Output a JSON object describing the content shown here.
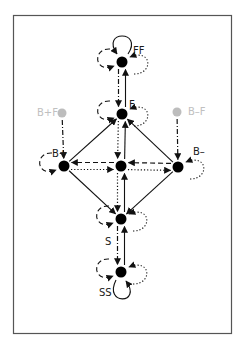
{
  "diagram": {
    "type": "state-transition",
    "colors": {
      "frame": "#555555",
      "node": "#000000",
      "ghost_node": "#bdbdbd",
      "edge": "#111111",
      "label": "#1a1a1a",
      "ghost_label": "#c0c0c0"
    },
    "nodes": [
      {
        "id": "FF",
        "label": "FF",
        "kind": "state"
      },
      {
        "id": "F",
        "label": "F",
        "kind": "state"
      },
      {
        "id": "BpF",
        "label": "B+F",
        "kind": "ghost"
      },
      {
        "id": "BmF",
        "label": "B–F",
        "kind": "ghost"
      },
      {
        "id": "Bp",
        "label": "B+",
        "kind": "state"
      },
      {
        "id": "C",
        "label": "",
        "kind": "state"
      },
      {
        "id": "Bm",
        "label": "B–",
        "kind": "state"
      },
      {
        "id": "S",
        "label": "S",
        "kind": "state"
      },
      {
        "id": "SS",
        "label": "SS",
        "kind": "state"
      }
    ],
    "edges": [
      {
        "from": "FF",
        "to": "F",
        "style": "dashdot"
      },
      {
        "from": "F",
        "to": "FF",
        "style": "solid"
      },
      {
        "from": "F",
        "to": "C",
        "style": "dotted"
      },
      {
        "from": "C",
        "to": "F",
        "style": "solid"
      },
      {
        "from": "C",
        "to": "S",
        "style": "dotted"
      },
      {
        "from": "S",
        "to": "C",
        "style": "solid"
      },
      {
        "from": "S",
        "to": "SS",
        "style": "dashdot"
      },
      {
        "from": "SS",
        "to": "S",
        "style": "solid"
      },
      {
        "from": "BpF",
        "to": "Bp",
        "style": "dashdot"
      },
      {
        "from": "BmF",
        "to": "Bm",
        "style": "dashdot"
      },
      {
        "from": "Bp",
        "to": "F",
        "style": "solid"
      },
      {
        "from": "Bm",
        "to": "F",
        "style": "solid"
      },
      {
        "from": "Bp",
        "to": "S",
        "style": "solid"
      },
      {
        "from": "Bm",
        "to": "S",
        "style": "solid"
      },
      {
        "from": "C",
        "to": "Bp",
        "style": "dashed"
      },
      {
        "from": "Bp",
        "to": "C",
        "style": "dotted"
      },
      {
        "from": "C",
        "to": "Bm",
        "style": "dotted"
      },
      {
        "from": "Bm",
        "to": "C",
        "style": "dashed"
      }
    ],
    "self_loops": [
      {
        "node": "FF",
        "side": "top",
        "style": "solid"
      },
      {
        "node": "FF",
        "side": "left",
        "style": "dashed"
      },
      {
        "node": "FF",
        "side": "right",
        "style": "dotted"
      },
      {
        "node": "F",
        "side": "left",
        "style": "dashed"
      },
      {
        "node": "F",
        "side": "right",
        "style": "dotted"
      },
      {
        "node": "Bp",
        "side": "left",
        "style": "dashed"
      },
      {
        "node": "Bm",
        "side": "right",
        "style": "dotted"
      },
      {
        "node": "S",
        "side": "left",
        "style": "dashed"
      },
      {
        "node": "S",
        "side": "right",
        "style": "dotted"
      },
      {
        "node": "SS",
        "side": "left",
        "style": "dashed"
      },
      {
        "node": "SS",
        "side": "right",
        "style": "dotted"
      },
      {
        "node": "SS",
        "side": "bottom",
        "style": "solid"
      }
    ]
  }
}
